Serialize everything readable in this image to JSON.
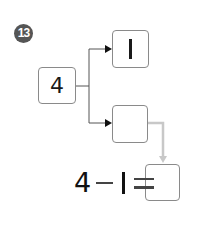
{
  "problem": {
    "number": "13"
  },
  "diagram": {
    "start_value": "4",
    "top_branch_value": "1",
    "bottom_branch_value": "",
    "answer_value": ""
  },
  "equation": {
    "left_operand": "4",
    "operator": "−",
    "right_operand": "1",
    "equals": "="
  },
  "colors": {
    "badge": "#555555",
    "box_border": "#8a8a8a",
    "connector_dark": "#333333",
    "connector_light": "#c8c8c8"
  }
}
